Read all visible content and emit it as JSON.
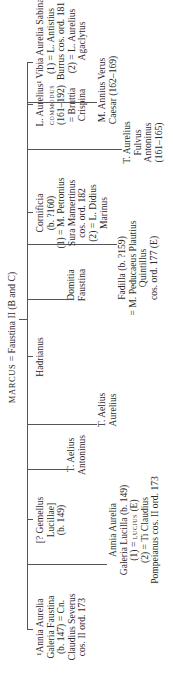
{
  "header": {
    "father": "MARCUS",
    "rest": " = Faustina II (B and C)"
  },
  "children": [
    {
      "lines": [
        "¹Annia Aurelia",
        "Galeria Faustina",
        "(b. 147) = Cn.",
        "Claudius Severus",
        "cos. II ord. 173"
      ]
    },
    {
      "lines": [
        "Annia Aurelia",
        "Galeria Lucilla (b. 149)",
        "(1) = LUCIUS (E)",
        "(2) = Ti Claudius",
        "Pompeianus cos. II ord. 173"
      ]
    },
    {
      "lines": [
        "[? Gemellus",
        "Lucillae]",
        "(b. 149)"
      ]
    },
    {
      "lines": [
        "T. Aelius",
        "Antoninus"
      ]
    },
    {
      "lines": [
        "T. Aelius",
        "Aurelius"
      ]
    },
    {
      "lines": [
        "Hadrianus"
      ]
    },
    {
      "lines": [
        "Domitia",
        "Faustina"
      ]
    },
    {
      "lines": [
        "Fadilla (b. ?159)",
        "= M. Peducaeus Plautius",
        "Quintillus",
        "cos. ord. 177 (E)"
      ]
    },
    {
      "lines": [
        "Cornificia",
        "(b. ?160)",
        "(1) = M. Petronius",
        "Sura Mamertinus",
        "cos. ord. 182",
        "(2) = L. Didius",
        "Marinus"
      ]
    },
    {
      "lines": [
        "T. Aurelius",
        "Fulvus",
        "Antoninus",
        "(161–165)"
      ]
    },
    {
      "lines": [
        "L. Aurelius",
        "COMMODUS",
        "(161–192)",
        "= Bruttia",
        "Crispina"
      ]
    },
    {
      "lines": [
        "M. Annius Verus",
        "Caesar (162–169)"
      ]
    },
    {
      "lines": [
        "¹ Vibia Aurelia Sabina",
        "(1) = L. Antistius",
        "Burrus cos. ord. 181",
        "(2) = L. Aurelius",
        "Agaclytus"
      ]
    }
  ]
}
